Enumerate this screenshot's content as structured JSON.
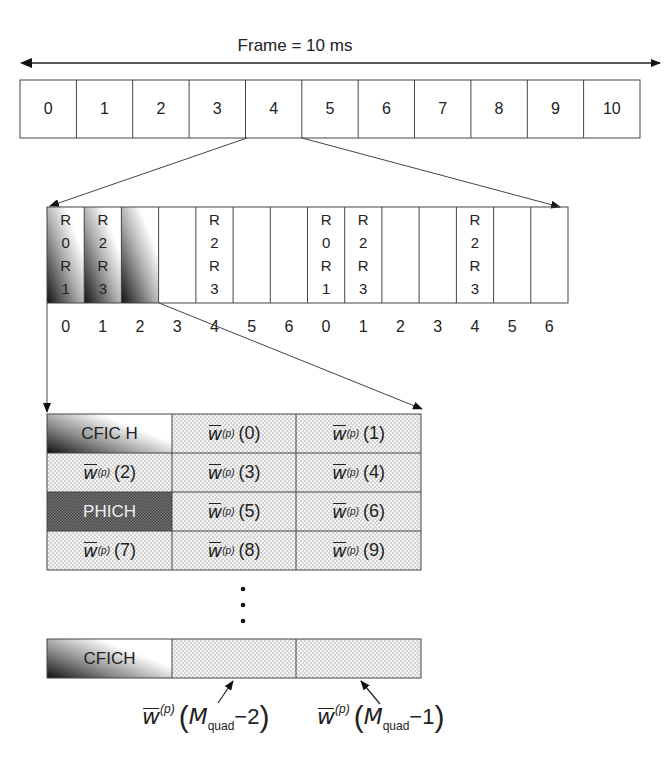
{
  "frame": {
    "title": "Frame = 10 ms",
    "subframes": [
      "0",
      "1",
      "2",
      "3",
      "4",
      "5",
      "6",
      "7",
      "8",
      "9",
      "10"
    ],
    "expanded_subframe_index": 4
  },
  "subframe_detail": {
    "symbols": [
      {
        "label": "0",
        "rs": [
          "R",
          "0",
          "R",
          "1"
        ],
        "shaded": true
      },
      {
        "label": "1",
        "rs": [
          "R",
          "2",
          "R",
          "3"
        ],
        "shaded": true
      },
      {
        "label": "2",
        "rs": [],
        "shaded": true
      },
      {
        "label": "3",
        "rs": [],
        "shaded": false
      },
      {
        "label": "4",
        "rs": [
          "R",
          "2",
          "R",
          "3"
        ],
        "shaded": false
      },
      {
        "label": "5",
        "rs": [],
        "shaded": false
      },
      {
        "label": "6",
        "rs": [],
        "shaded": false
      },
      {
        "label": "0",
        "rs": [
          "R",
          "0",
          "R",
          "1"
        ],
        "shaded": false
      },
      {
        "label": "1",
        "rs": [
          "R",
          "2",
          "R",
          "3"
        ],
        "shaded": false
      },
      {
        "label": "2",
        "rs": [],
        "shaded": false
      },
      {
        "label": "3",
        "rs": [],
        "shaded": false
      },
      {
        "label": "4",
        "rs": [
          "R",
          "2",
          "R",
          "3"
        ],
        "shaded": false
      },
      {
        "label": "5",
        "rs": [],
        "shaded": false
      },
      {
        "label": "6",
        "rs": [],
        "shaded": false
      }
    ]
  },
  "resource_grid": {
    "rows": [
      [
        {
          "type": "cfich",
          "text": "CFIC H"
        },
        {
          "type": "w",
          "sup": "(p)",
          "idx": "(0)"
        },
        {
          "type": "w",
          "sup": "(p)",
          "idx": "(1)"
        }
      ],
      [
        {
          "type": "w",
          "sup": "(p)",
          "idx": "(2)"
        },
        {
          "type": "w",
          "sup": "(p)",
          "idx": "(3)"
        },
        {
          "type": "w",
          "sup": "(p)",
          "idx": "(4)"
        }
      ],
      [
        {
          "type": "phich",
          "text": "PHICH"
        },
        {
          "type": "w",
          "sup": "(p)",
          "idx": "(5)"
        },
        {
          "type": "w",
          "sup": "(p)",
          "idx": "(6)"
        }
      ],
      [
        {
          "type": "w",
          "sup": "(p)",
          "idx": "(7)"
        },
        {
          "type": "w",
          "sup": "(p)",
          "idx": "(8)"
        },
        {
          "type": "w",
          "sup": "(p)",
          "idx": "(9)"
        }
      ]
    ],
    "ellipsis": "⋮",
    "last_row": {
      "cfich_text": "CFICH"
    },
    "annotations": [
      {
        "w": "w",
        "sup": "(p)",
        "M": "M",
        "sub": "quad",
        "tail": "−2"
      },
      {
        "w": "w",
        "sup": "(p)",
        "M": "M",
        "sub": "quad",
        "tail": "−1"
      }
    ]
  },
  "colors": {
    "line": "#333333",
    "dot": "#9a9a9a",
    "dense": "#555555",
    "shade_dark": "#111111"
  }
}
